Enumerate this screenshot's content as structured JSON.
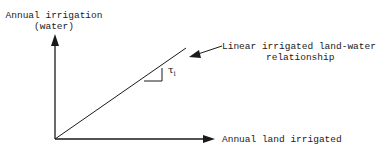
{
  "diagram": {
    "y_axis": {
      "label_line1": "Annual irrigation",
      "label_line2": "(water)"
    },
    "x_axis": {
      "label": "Annual land irrigated"
    },
    "line_annotation": {
      "line1": "Linear irrigated land-water",
      "line2": "relationship"
    },
    "slope_label": {
      "symbol": "τ",
      "subscript": "i"
    },
    "colors": {
      "ink": "#1a1a1a",
      "background": "#ffffff"
    }
  }
}
